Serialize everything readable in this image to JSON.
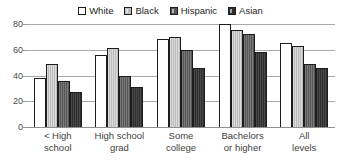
{
  "chart_data": {
    "type": "bar",
    "title": "",
    "subtitle": "",
    "xlabel": "",
    "ylabel": "",
    "ylim": [
      0,
      80
    ],
    "y_ticks": [
      0,
      20,
      40,
      60,
      80
    ],
    "grid": true,
    "legend_position": "top-center",
    "categories": [
      "< High\nschool",
      "High school\ngrad",
      "Some\ncollege",
      "Bachelors\nor higher",
      "All\nlevels"
    ],
    "series": [
      {
        "name": "White",
        "color": "#ffffff",
        "values": [
          38,
          56,
          68,
          80,
          65
        ]
      },
      {
        "name": "Black",
        "color": "#bcbcbc",
        "values": [
          49,
          61,
          70,
          75,
          63
        ]
      },
      {
        "name": "Hispanic",
        "color": "#575757",
        "values": [
          36,
          40,
          60,
          72,
          49
        ]
      },
      {
        "name": "Asian",
        "color": "#2e2e2e",
        "values": [
          27,
          31,
          46,
          58,
          46
        ]
      }
    ]
  },
  "legend": {
    "items": [
      {
        "label": "White",
        "swatch": "legend-swatch-white"
      },
      {
        "label": "Black",
        "swatch": "legend-swatch-black"
      },
      {
        "label": "Hispanic",
        "swatch": "legend-swatch-hispanic"
      },
      {
        "label": "Asian",
        "swatch": "legend-swatch-asian"
      }
    ]
  },
  "axis": {
    "y_tick_labels": [
      "80",
      "60",
      "40",
      "20",
      "0"
    ]
  },
  "colors": {
    "gridline": "#a9a9a9",
    "bar_outline": "#1d1d1d",
    "text": "#3a3a3a"
  }
}
